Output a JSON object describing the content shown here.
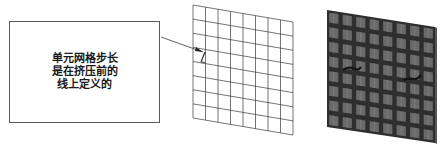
{
  "callout": {
    "lines": [
      "单元网格步长",
      "是在挤压前的",
      "线上定义的"
    ]
  },
  "diagram": {
    "wire_mesh": {
      "rows": 8,
      "cols": 8,
      "corners": {
        "tl": [
          193,
          5
        ],
        "tr": [
          293,
          22
        ],
        "bl": [
          193,
          118
        ],
        "br": [
          293,
          135
        ]
      },
      "line_color": "#3a3a3a"
    },
    "solid_mesh": {
      "rows": 8,
      "cols": 8,
      "corners": {
        "tl": [
          327,
          10
        ],
        "tr": [
          435,
          27
        ],
        "bl": [
          327,
          127
        ],
        "br": [
          435,
          143
        ]
      },
      "fill_color": "#6a6a6a",
      "grout_color": "#2e2e2e"
    },
    "leader": {
      "from": [
        161,
        37
      ],
      "to": [
        203,
        52
      ]
    }
  }
}
